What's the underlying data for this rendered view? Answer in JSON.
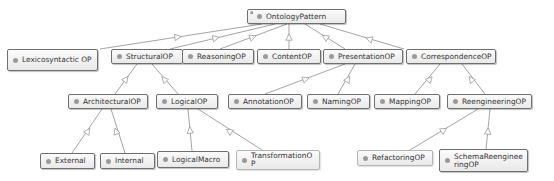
{
  "diagram": {
    "root": {
      "id": "OntologyPattern",
      "label": "OntologyPattern",
      "marker": "a"
    },
    "nodes": [
      {
        "id": "OntologyPattern",
        "label": "OntologyPattern",
        "x": 247,
        "y": 9,
        "w": 99,
        "h": 15
      },
      {
        "id": "LexicosyntacticOP",
        "label": "Lexicosyntactic OP",
        "x": 7,
        "y": 49,
        "w": 91,
        "h": 22
      },
      {
        "id": "StructuralOP",
        "label": "StructuralOP",
        "x": 111,
        "y": 49,
        "w": 72,
        "h": 15
      },
      {
        "id": "ReasoningOP",
        "label": "ReasoningOP",
        "x": 182,
        "y": 49,
        "w": 72,
        "h": 15
      },
      {
        "id": "ContentOP",
        "label": "ContentOP",
        "x": 257,
        "y": 49,
        "w": 64,
        "h": 15
      },
      {
        "id": "PresentationOP",
        "label": "PresentationOP",
        "x": 323,
        "y": 49,
        "w": 80,
        "h": 15
      },
      {
        "id": "CorrespondenceOP",
        "label": "CorrespondenceOP",
        "x": 406,
        "y": 49,
        "w": 90,
        "h": 15
      },
      {
        "id": "ArchitecturalOP",
        "label": "ArchitecturalOP",
        "x": 68,
        "y": 94,
        "w": 80,
        "h": 15
      },
      {
        "id": "LogicalOP",
        "label": "LogicalOP",
        "x": 156,
        "y": 94,
        "w": 62,
        "h": 15
      },
      {
        "id": "AnnotationOP",
        "label": "AnnotationOP",
        "x": 228,
        "y": 94,
        "w": 74,
        "h": 15
      },
      {
        "id": "NamingOP",
        "label": "NamingOP",
        "x": 307,
        "y": 94,
        "w": 63,
        "h": 15
      },
      {
        "id": "MappingOP",
        "label": "MappingOP",
        "x": 374,
        "y": 94,
        "w": 66,
        "h": 15
      },
      {
        "id": "ReengineeringOP",
        "label": "ReengineeringOP",
        "x": 447,
        "y": 94,
        "w": 85,
        "h": 15
      },
      {
        "id": "External",
        "label": "External",
        "x": 40,
        "y": 153,
        "w": 55,
        "h": 16
      },
      {
        "id": "Internal",
        "label": "Internal",
        "x": 100,
        "y": 153,
        "w": 55,
        "h": 16
      },
      {
        "id": "LogicalMacro",
        "label": "LogicalMacro",
        "x": 157,
        "y": 151,
        "w": 72,
        "h": 17
      },
      {
        "id": "TransformationOP",
        "label": "TransformationOP",
        "x": 236,
        "y": 150,
        "w": 84,
        "h": 20,
        "light": true
      },
      {
        "id": "RefactoringOP",
        "label": "RefactoringOP",
        "x": 357,
        "y": 150,
        "w": 76,
        "h": 16,
        "light": true
      },
      {
        "id": "SchemaReengineeringOP",
        "label": "SchemaReengineeringOP",
        "x": 439,
        "y": 149,
        "w": 89,
        "h": 23
      }
    ],
    "edges": [
      {
        "from": "LexicosyntacticOP",
        "to": "OntologyPattern",
        "x1": 100,
        "y1": 49,
        "x2": 262,
        "y2": 24,
        "ax": 178,
        "ay": 37
      },
      {
        "from": "StructuralOP",
        "to": "OntologyPattern",
        "x1": 170,
        "y1": 49,
        "x2": 275,
        "y2": 24,
        "ax": 216,
        "ay": 38
      },
      {
        "from": "ReasoningOP",
        "to": "OntologyPattern",
        "x1": 220,
        "y1": 49,
        "x2": 287,
        "y2": 24,
        "ax": 253,
        "ay": 37
      },
      {
        "from": "ContentOP",
        "to": "OntologyPattern",
        "x1": 289,
        "y1": 49,
        "x2": 289,
        "y2": 24,
        "ax": 289,
        "ay": 37
      },
      {
        "from": "PresentationOP",
        "to": "OntologyPattern",
        "x1": 345,
        "y1": 49,
        "x2": 305,
        "y2": 24,
        "ax": 325,
        "ay": 37
      },
      {
        "from": "CorrespondenceOP",
        "to": "OntologyPattern",
        "x1": 404,
        "y1": 49,
        "x2": 320,
        "y2": 24,
        "ax": 369,
        "ay": 39
      },
      {
        "from": "ArchitecturalOP",
        "to": "StructuralOP",
        "x1": 115,
        "y1": 94,
        "x2": 137,
        "y2": 64,
        "ax": 126,
        "ay": 79
      },
      {
        "from": "LogicalOP",
        "to": "StructuralOP",
        "x1": 178,
        "y1": 94,
        "x2": 152,
        "y2": 64,
        "ax": 164,
        "ay": 79
      },
      {
        "from": "AnnotationOP",
        "to": "PresentationOP",
        "x1": 265,
        "y1": 94,
        "x2": 345,
        "y2": 64,
        "ax": 306,
        "ay": 79
      },
      {
        "from": "NamingOP",
        "to": "PresentationOP",
        "x1": 338,
        "y1": 94,
        "x2": 355,
        "y2": 64,
        "ax": 348,
        "ay": 79
      },
      {
        "from": "MappingOP",
        "to": "CorrespondenceOP",
        "x1": 415,
        "y1": 94,
        "x2": 440,
        "y2": 64,
        "ax": 430,
        "ay": 79
      },
      {
        "from": "ReengineeringOP",
        "to": "CorrespondenceOP",
        "x1": 485,
        "y1": 94,
        "x2": 462,
        "y2": 64,
        "ax": 471,
        "ay": 79
      },
      {
        "from": "External",
        "to": "ArchitecturalOP",
        "x1": 72,
        "y1": 153,
        "x2": 102,
        "y2": 109,
        "ax": 88,
        "ay": 131
      },
      {
        "from": "Internal",
        "to": "ArchitecturalOP",
        "x1": 125,
        "y1": 153,
        "x2": 111,
        "y2": 109,
        "ax": 116,
        "ay": 131
      },
      {
        "from": "LogicalMacro",
        "to": "LogicalOP",
        "x1": 192,
        "y1": 151,
        "x2": 188,
        "y2": 109,
        "ax": 190,
        "ay": 130
      },
      {
        "from": "TransformationOP",
        "to": "LogicalOP",
        "x1": 262,
        "y1": 150,
        "x2": 198,
        "y2": 109,
        "ax": 229,
        "ay": 131
      },
      {
        "from": "RefactoringOP",
        "to": "ReengineeringOP",
        "x1": 410,
        "y1": 150,
        "x2": 478,
        "y2": 109,
        "ax": 444,
        "ay": 130
      },
      {
        "from": "SchemaReengineeringOP",
        "to": "ReengineeringOP",
        "x1": 486,
        "y1": 149,
        "x2": 490,
        "y2": 109,
        "ax": 488,
        "ay": 131
      }
    ],
    "colors": {
      "edge": "#9a9a9a",
      "node_border": "#6f6f6f",
      "node_bg_top": "#fbfbfb",
      "node_bg_bottom": "#e9e9e9",
      "dot": "#9a9a9a",
      "text": "#333333"
    }
  }
}
